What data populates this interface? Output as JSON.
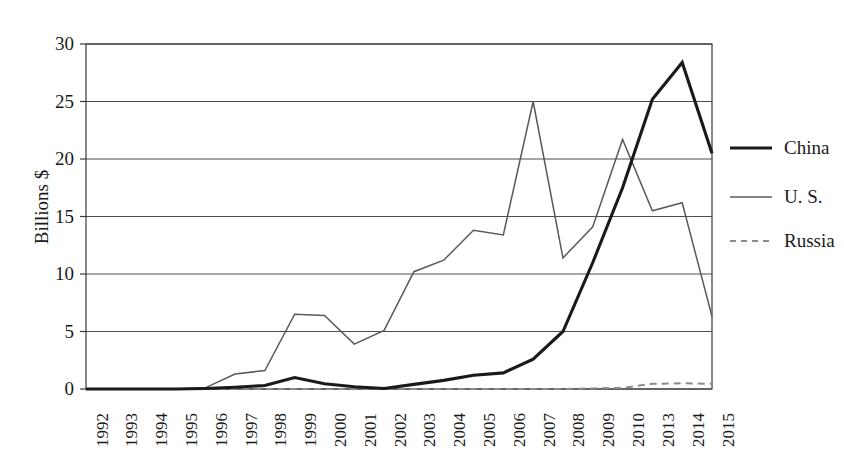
{
  "chart_data": {
    "type": "line",
    "title": "",
    "xlabel": "",
    "ylabel": "Billions $",
    "ylim": [
      0,
      30
    ],
    "yticks": [
      0,
      5,
      10,
      15,
      20,
      25,
      30
    ],
    "grid": "horizontal",
    "legend_position": "right",
    "categories": [
      "1992",
      "1993",
      "1994",
      "1995",
      "1996",
      "1997",
      "1998",
      "1999",
      "2000",
      "2001",
      "2002",
      "2003",
      "2004",
      "2005",
      "2006",
      "2007",
      "2008",
      "2009",
      "2010",
      "2013",
      "2014",
      "2015"
    ],
    "series": [
      {
        "name": "China",
        "style": "solid",
        "color": "#1a1a1a",
        "width": 3.1,
        "values": [
          0.0,
          0.0,
          0.0,
          0.0,
          0.05,
          0.15,
          0.3,
          1.0,
          0.45,
          0.2,
          0.05,
          0.4,
          0.75,
          1.2,
          1.4,
          2.6,
          5.0,
          11.0,
          17.5,
          25.2,
          28.4,
          20.5
        ]
      },
      {
        "name": "U. S.",
        "style": "solid",
        "color": "#5a5a5a",
        "width": 1.5,
        "values": [
          0.0,
          0.0,
          0.0,
          0.0,
          0.1,
          1.3,
          1.6,
          6.5,
          6.4,
          3.9,
          5.1,
          10.2,
          11.2,
          13.8,
          13.4,
          25.0,
          11.4,
          14.1,
          21.7,
          15.5,
          16.2,
          6.3
        ]
      },
      {
        "name": "Russia",
        "style": "dashed",
        "color": "#8a8a8a",
        "width": 2.0,
        "values": [
          0.0,
          0.0,
          0.0,
          0.0,
          0.0,
          0.0,
          0.0,
          0.0,
          0.0,
          0.0,
          0.0,
          0.0,
          0.0,
          0.0,
          0.0,
          0.0,
          0.0,
          0.05,
          0.1,
          0.45,
          0.5,
          0.45
        ]
      }
    ]
  },
  "axis": {
    "y_title": "Billions $",
    "y_tick_labels": [
      "30",
      "25",
      "20",
      "15",
      "10",
      "5",
      "0"
    ],
    "x_tick_labels": [
      "1992",
      "1993",
      "1994",
      "1995",
      "1996",
      "1997",
      "1998",
      "1999",
      "2000",
      "2001",
      "2002",
      "2003",
      "2004",
      "2005",
      "2006",
      "2007",
      "2008",
      "2009",
      "2010",
      "2013",
      "2014",
      "2015"
    ]
  },
  "legend": {
    "items": [
      {
        "label": "China",
        "swatch": "legend-line-solid-black"
      },
      {
        "label": "U. S.",
        "swatch": "legend-line-solid-gray"
      },
      {
        "label": "Russia",
        "swatch": "legend-line-dashed-gray"
      }
    ]
  },
  "plot_geometry": {
    "left": 86,
    "right": 712,
    "top": 44,
    "bottom": 389
  }
}
